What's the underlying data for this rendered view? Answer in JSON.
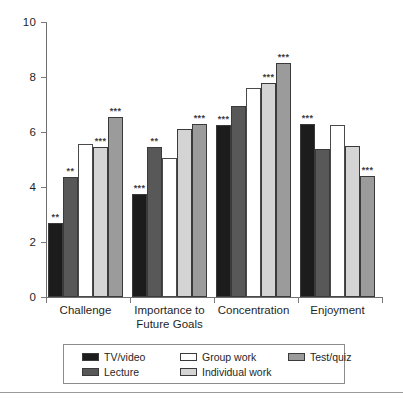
{
  "chart_data": {
    "type": "bar",
    "title": "",
    "xlabel": "",
    "ylabel": "",
    "ylim": [
      0,
      10
    ],
    "yticks": [
      0,
      2,
      4,
      6,
      8,
      10
    ],
    "ytick_labels": [
      "0",
      "2",
      "4",
      "6",
      "8",
      "10"
    ],
    "grid": false,
    "legend_position": "bottom",
    "categories": [
      "Challenge",
      "Importance to\nFuture Goals",
      "Concentration",
      "Enjoyment"
    ],
    "series": [
      {
        "name": "TV/video",
        "color": "#1c1c1c",
        "values": [
          2.7,
          3.75,
          6.25,
          6.3
        ],
        "annotations": [
          "**",
          "***",
          "***",
          "***"
        ]
      },
      {
        "name": "Lecture",
        "color": "#585858",
        "values": [
          4.35,
          5.45,
          6.95,
          5.4
        ],
        "annotations": [
          "**",
          "**",
          "",
          ""
        ]
      },
      {
        "name": "Group work",
        "color": "#ffffff",
        "values": [
          5.55,
          5.05,
          7.6,
          6.25
        ],
        "annotations": [
          "",
          "",
          "",
          ""
        ]
      },
      {
        "name": "Individual work",
        "color": "#d4d4d4",
        "values": [
          5.45,
          6.1,
          7.8,
          5.5
        ],
        "annotations": [
          "***",
          "",
          "***",
          ""
        ]
      },
      {
        "name": "Test/quiz",
        "color": "#9b9b9b",
        "values": [
          6.55,
          6.3,
          8.5,
          4.4
        ],
        "annotations": [
          "***",
          "***",
          "***",
          "***"
        ]
      }
    ]
  },
  "axis": {
    "y_labels": [
      "10",
      "8",
      "6",
      "4",
      "2",
      "0"
    ]
  },
  "category_labels": [
    "Challenge",
    "Importance to\nFuture Goals",
    "Concentration",
    "Enjoyment"
  ],
  "legend": {
    "items": [
      {
        "label": "TV/video",
        "color": "#1c1c1c"
      },
      {
        "label": "Group work",
        "color": "#ffffff"
      },
      {
        "label": "Test/quiz",
        "color": "#9b9b9b"
      },
      {
        "label": "Lecture",
        "color": "#585858"
      },
      {
        "label": "Individual work",
        "color": "#d4d4d4"
      }
    ]
  }
}
